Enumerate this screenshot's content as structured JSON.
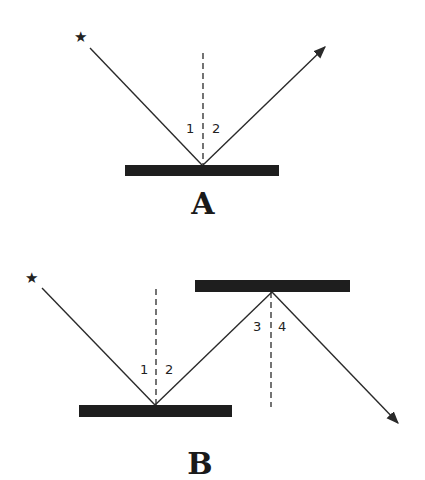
{
  "diagram": {
    "panels": [
      {
        "label": "A",
        "light_source": "★",
        "mirrors": 1,
        "angles": [
          "1",
          "2"
        ]
      },
      {
        "label": "B",
        "light_source": "★",
        "mirrors": 2,
        "angles": [
          "1",
          "2",
          "3",
          "4"
        ]
      }
    ]
  }
}
